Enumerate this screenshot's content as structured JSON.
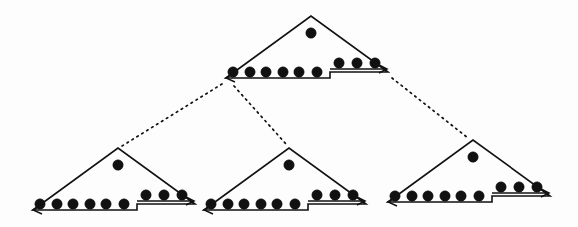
{
  "figure": {
    "background_color": "#fdfdfd",
    "ink_color": "#111111",
    "node_count": 4,
    "edge_count": 3
  },
  "chart_data": {
    "type": "diagram",
    "title": "",
    "subtitle": "",
    "xlabel": "",
    "ylabel": "",
    "layout": "tree",
    "node_shape": "stepped-triangle",
    "nodes": [
      {
        "id": "root",
        "label": "",
        "apex": [
          311,
          16
        ],
        "base_left": [
          226,
          78
        ],
        "base_right": [
          388,
          72
        ],
        "step_x": 330,
        "ledge_y": 69,
        "base_y": 78,
        "apex_dot": [
          311,
          33
        ],
        "lower_dot_count": 6,
        "ledge_dot_count": 3,
        "apex_dot_count": 1,
        "total_dots": 10,
        "lower_dots": [
          [
            233,
            72
          ],
          [
            250,
            72
          ],
          [
            266,
            72
          ],
          [
            283,
            72
          ],
          [
            299,
            72
          ],
          [
            317,
            72
          ]
        ],
        "ledge_dots": [
          [
            339,
            63
          ],
          [
            357,
            63
          ],
          [
            375,
            63
          ]
        ],
        "has_arrow": true,
        "arrow_at": [
          226,
          78
        ]
      },
      {
        "id": "child-left",
        "label": "",
        "apex": [
          118,
          148
        ],
        "base_left": [
          33,
          210
        ],
        "base_right": [
          195,
          204
        ],
        "step_x": 137,
        "ledge_y": 201,
        "base_y": 210,
        "apex_dot": [
          118,
          165
        ],
        "lower_dot_count": 6,
        "ledge_dot_count": 3,
        "apex_dot_count": 1,
        "total_dots": 10,
        "lower_dots": [
          [
            40,
            204
          ],
          [
            57,
            204
          ],
          [
            73,
            204
          ],
          [
            90,
            204
          ],
          [
            106,
            204
          ],
          [
            124,
            204
          ]
        ],
        "ledge_dots": [
          [
            146,
            195
          ],
          [
            164,
            195
          ],
          [
            182,
            195
          ]
        ],
        "has_arrow": true,
        "arrow_at": [
          33,
          210
        ]
      },
      {
        "id": "child-middle",
        "label": "",
        "apex": [
          289,
          148
        ],
        "base_left": [
          204,
          210
        ],
        "base_right": [
          366,
          204
        ],
        "step_x": 308,
        "ledge_y": 201,
        "base_y": 210,
        "apex_dot": [
          289,
          165
        ],
        "lower_dot_count": 6,
        "ledge_dot_count": 3,
        "apex_dot_count": 1,
        "total_dots": 10,
        "lower_dots": [
          [
            211,
            204
          ],
          [
            228,
            204
          ],
          [
            244,
            204
          ],
          [
            261,
            204
          ],
          [
            277,
            204
          ],
          [
            295,
            204
          ]
        ],
        "ledge_dots": [
          [
            317,
            195
          ],
          [
            335,
            195
          ],
          [
            353,
            195
          ]
        ],
        "has_arrow": true,
        "arrow_at": [
          204,
          210
        ]
      },
      {
        "id": "child-right",
        "label": "",
        "apex": [
          473,
          140
        ],
        "base_left": [
          388,
          202
        ],
        "base_right": [
          550,
          196
        ],
        "step_x": 492,
        "ledge_y": 193,
        "base_y": 202,
        "apex_dot": [
          473,
          157
        ],
        "lower_dot_count": 6,
        "ledge_dot_count": 3,
        "apex_dot_count": 1,
        "total_dots": 10,
        "lower_dots": [
          [
            395,
            196
          ],
          [
            412,
            196
          ],
          [
            428,
            196
          ],
          [
            445,
            196
          ],
          [
            461,
            196
          ],
          [
            479,
            196
          ]
        ],
        "ledge_dots": [
          [
            501,
            187
          ],
          [
            519,
            187
          ],
          [
            537,
            187
          ]
        ],
        "has_arrow": true,
        "arrow_at": [
          388,
          202
        ]
      }
    ],
    "edges": [
      {
        "id": "edge-root-left",
        "from": "root",
        "to": "child-left",
        "style": "dotted",
        "x1": 222,
        "y1": 84,
        "x2": 122,
        "y2": 146
      },
      {
        "id": "edge-root-middle",
        "from": "root",
        "to": "child-middle",
        "style": "dotted",
        "x1": 234,
        "y1": 86,
        "x2": 286,
        "y2": 144
      },
      {
        "id": "edge-root-right",
        "from": "root",
        "to": "child-right",
        "style": "dotted",
        "x1": 392,
        "y1": 78,
        "x2": 468,
        "y2": 138
      }
    ],
    "dot_radius": 5.2,
    "legend": [],
    "annotations": []
  }
}
